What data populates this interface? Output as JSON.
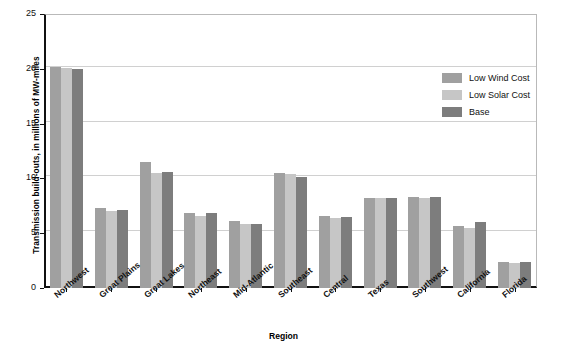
{
  "chart_data": {
    "type": "bar",
    "title": "",
    "xlabel": "Region",
    "ylabel": "Transmission build-outs, in millions of MW-miles",
    "ylim": [
      0,
      25
    ],
    "yticks": [
      0,
      5,
      10,
      15,
      20,
      25
    ],
    "ytick_labels": [
      "0",
      "5",
      "10",
      "15",
      "20",
      "25"
    ],
    "grid": "horizontal",
    "legend_position": "upper-right-inside",
    "categories": [
      "Northwest",
      "Great Plains",
      "Great Lakes",
      "Northeast",
      "Mid-Atlantic",
      "Southeast",
      "Central",
      "Texas",
      "Southwest",
      "California",
      "Florida"
    ],
    "series": [
      {
        "name": "Low Wind Cost",
        "color": "#a0a0a0",
        "values": [
          20.2,
          7.3,
          11.5,
          6.8,
          6.1,
          10.5,
          6.6,
          8.2,
          8.3,
          5.7,
          2.4
        ]
      },
      {
        "name": "Low Solar Cost",
        "color": "#c6c6c6",
        "values": [
          20.1,
          7.0,
          10.5,
          6.6,
          5.8,
          10.4,
          6.4,
          8.2,
          8.2,
          5.5,
          2.3
        ]
      },
      {
        "name": "Base",
        "color": "#7d7d7d",
        "values": [
          20.0,
          7.1,
          10.6,
          6.8,
          5.8,
          10.1,
          6.5,
          8.2,
          8.3,
          6.0,
          2.4
        ]
      }
    ]
  },
  "axes": {
    "y_title": "Transmission build-outs, in millions of MW-miles",
    "x_title": "Region"
  },
  "legend": {
    "items": [
      {
        "label": "Low Wind Cost",
        "color": "#a0a0a0"
      },
      {
        "label": "Low Solar Cost",
        "color": "#c6c6c6"
      },
      {
        "label": "Base",
        "color": "#7d7d7d"
      }
    ]
  },
  "colors": {
    "low_wind_cost": "#a0a0a0",
    "low_solar_cost": "#c6c6c6",
    "base": "#7d7d7d",
    "axis": "#111111",
    "gridline": "#d0d0d0",
    "background": "#ffffff"
  }
}
